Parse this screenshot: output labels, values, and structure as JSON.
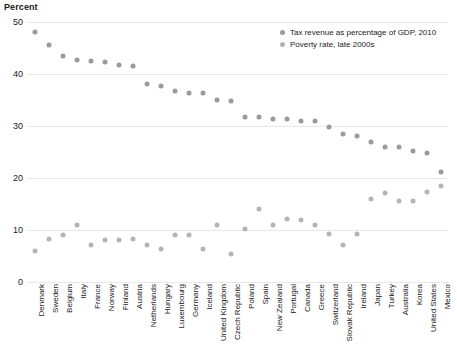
{
  "chart_data": {
    "type": "scatter",
    "title": "",
    "ylabel": "Percent",
    "xlabel": "",
    "ylim": [
      0,
      50
    ],
    "yticks": [
      0,
      10,
      20,
      30,
      40,
      50
    ],
    "grid": true,
    "legend_position": "top-right",
    "categories": [
      "Denmark",
      "Sweden",
      "Belgium",
      "Italy",
      "France",
      "Norway",
      "Finland",
      "Austria",
      "Netherlands",
      "Hungary",
      "Luxembourg",
      "Germany",
      "Iceland",
      "United Kingdom",
      "Czech Republic",
      "Poland",
      "Spain",
      "New Zealand",
      "Portugal",
      "Canada",
      "Greece",
      "Switzerland",
      "Slovak Republic",
      "Ireland",
      "Japan",
      "Turkey",
      "Australia",
      "Korea",
      "United States",
      "Mexico"
    ],
    "series": [
      {
        "name": "Tax revenue as percentage of GDP, 2010",
        "color": "#9a9a9a",
        "values": [
          48.0,
          45.5,
          43.5,
          42.6,
          42.5,
          42.4,
          41.7,
          41.6,
          38.1,
          37.7,
          36.7,
          36.4,
          36.3,
          35.0,
          34.9,
          31.8,
          31.7,
          31.3,
          31.3,
          31.0,
          30.9,
          29.8,
          28.4,
          28.0,
          27.0,
          26.0,
          25.9,
          25.1,
          24.8,
          21.1
        ]
      },
      {
        "name": "Poverty rate, late  2000s",
        "color": "#b4b4b4",
        "values": [
          6.0,
          8.2,
          9.1,
          11.0,
          7.2,
          8.1,
          8.1,
          8.2,
          7.2,
          6.3,
          9.1,
          9.1,
          6.3,
          11.0,
          5.4,
          10.2,
          14.1,
          11.0,
          12.1,
          12.0,
          11.0,
          9.2,
          7.2,
          9.2,
          16.0,
          17.1,
          15.5,
          15.5,
          17.3,
          18.5
        ]
      }
    ]
  },
  "chart": {
    "axis_title": "Percent",
    "legend": [
      {
        "label": "Tax revenue as percentage of GDP, 2010",
        "marker": "dot-marker-tax"
      },
      {
        "label": "Poverty rate, late  2000s",
        "marker": "dot-marker-poverty"
      }
    ]
  }
}
